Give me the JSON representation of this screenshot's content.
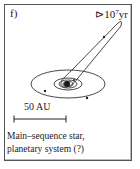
{
  "panel": {
    "label": "f)",
    "time_prefix": "⊳",
    "time_base": "10",
    "time_exponent": "7",
    "time_unit": "yr",
    "scale_bar_label": "50 AU",
    "caption_line1": "Main–sequence star,",
    "caption_line2": "planetary system (?)"
  },
  "diagram": {
    "star_center": [
      67,
      84
    ],
    "orbits": [
      {
        "type": "ellipse",
        "rx": 37,
        "ry": 14,
        "dots": [
          [
            45,
            91
          ],
          [
            87,
            98
          ]
        ]
      },
      {
        "type": "ellipse",
        "rx": 14,
        "ry": 6
      },
      {
        "type": "ellipse",
        "rx": 9,
        "ry": 4
      },
      {
        "type": "ellipse",
        "rx": 5,
        "ry": 2.5
      }
    ],
    "eccentric_orbit": {
      "apex": [
        121,
        22
      ],
      "dot": [
        104,
        37
      ]
    },
    "stroke_color": "#333333"
  }
}
